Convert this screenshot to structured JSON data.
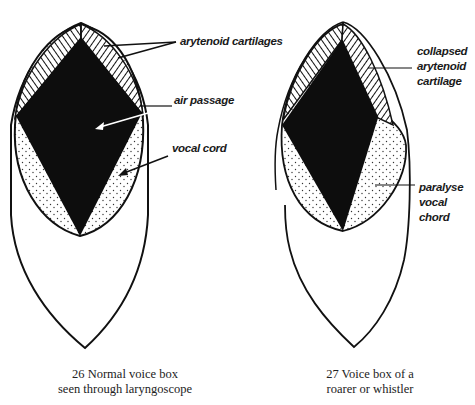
{
  "figure_left": {
    "number": "26",
    "caption_line1": "26 Normal voice box",
    "caption_line2": "seen through laryngoscope",
    "labels": {
      "arytenoid": "arytenoid cartilages",
      "air_passage": "air passage",
      "vocal_cord": "vocal cord"
    }
  },
  "figure_right": {
    "number": "27",
    "caption_line1": "27 Voice box of a",
    "caption_line2": "roarer or whistler",
    "labels": {
      "collapsed_line1": "collapsed",
      "collapsed_line2": "arytenoid",
      "collapsed_line3": "cartilage",
      "paralyse_line1": "paralyse",
      "paralyse_line2": "vocal",
      "paralyse_line3": "chord"
    }
  },
  "colors": {
    "ink": "#111111",
    "paper": "#ffffff",
    "stipple": "#333333"
  }
}
